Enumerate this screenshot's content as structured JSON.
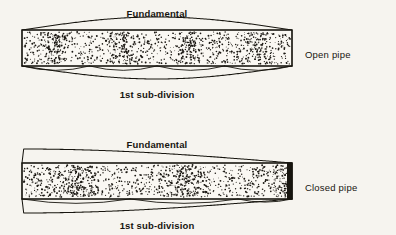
{
  "figure": {
    "background_color": "#f6f4ef",
    "ink_color": "#17150f",
    "paper_color": "#faf8f3"
  },
  "diagrams": [
    {
      "id": "open-pipe",
      "side_label": "Open pipe",
      "top_label": "Fundamental",
      "bottom_label": "1st sub-division",
      "left_end": "open",
      "right_end": "open",
      "fundamental_lobes": 2,
      "subdivision_lobes": 4,
      "pipe": {
        "x": 22,
        "y": 30,
        "width": 270,
        "height": 36
      },
      "top_label_pos": {
        "x": 157,
        "y": 17
      },
      "bottom_label_pos": {
        "x": 157,
        "y": 98
      },
      "side_label_pos": {
        "x": 305,
        "y": 58
      }
    },
    {
      "id": "closed-pipe",
      "side_label": "Closed pipe",
      "top_label": "Fundamental",
      "bottom_label": "1st sub-division",
      "left_end": "open",
      "right_end": "closed",
      "fundamental_lobes": 1,
      "subdivision_lobes": 3,
      "pipe": {
        "x": 22,
        "y": 163,
        "width": 270,
        "height": 36
      },
      "top_label_pos": {
        "x": 157,
        "y": 148
      },
      "bottom_label_pos": {
        "x": 157,
        "y": 229
      },
      "side_label_pos": {
        "x": 305,
        "y": 191
      }
    }
  ]
}
